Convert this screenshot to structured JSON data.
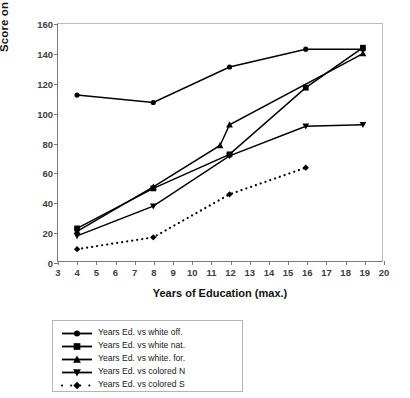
{
  "chart_data": {
    "type": "line",
    "title": "",
    "xlabel": "Years of Education (max.)",
    "ylabel": "Score on Army Mental Test",
    "xlim": [
      3,
      20
    ],
    "ylim": [
      0,
      160
    ],
    "xticks": [
      3,
      4,
      5,
      6,
      7,
      8,
      9,
      10,
      11,
      12,
      13,
      14,
      15,
      16,
      17,
      18,
      19,
      20
    ],
    "yticks": [
      0,
      20,
      40,
      60,
      80,
      100,
      120,
      140,
      160
    ],
    "grid": false,
    "legend_position": "below-plot",
    "series": [
      {
        "name": "Years Ed. vs white off.",
        "marker": "circle",
        "line": "solid",
        "x": [
          4,
          8,
          12,
          16,
          19
        ],
        "y": [
          112,
          107,
          131,
          143,
          143
        ]
      },
      {
        "name": "Years Ed. vs white nat.",
        "marker": "square",
        "line": "solid",
        "x": [
          4,
          8,
          12,
          16,
          19
        ],
        "y": [
          22,
          49,
          72,
          117,
          144
        ]
      },
      {
        "name": "Years Ed. vs white. for.",
        "marker": "triangle-up",
        "line": "solid",
        "x": [
          4,
          8,
          11.5,
          12,
          19
        ],
        "y": [
          20,
          50,
          78,
          92,
          140
        ]
      },
      {
        "name": "Years Ed. vs colored N",
        "marker": "triangle-down",
        "line": "solid",
        "x": [
          4,
          8,
          12,
          16,
          19
        ],
        "y": [
          17,
          37,
          71,
          91,
          92
        ]
      },
      {
        "name": "Years Ed. vs colored S",
        "marker": "diamond",
        "line": "dotted",
        "x": [
          4,
          8,
          12,
          16
        ],
        "y": [
          8,
          16,
          45,
          63
        ]
      }
    ]
  },
  "axes": {
    "y_label": "Score on Army Mental Test",
    "x_label": "Years of Education (max.)",
    "y_tick_labels": [
      "0",
      "20",
      "40",
      "60",
      "80",
      "100",
      "120",
      "140",
      "160"
    ],
    "x_tick_labels": [
      "3",
      "4",
      "5",
      "6",
      "7",
      "8",
      "9",
      "10",
      "11",
      "12",
      "13",
      "14",
      "15",
      "16",
      "17",
      "18",
      "19",
      "20"
    ]
  },
  "legend": {
    "items": [
      {
        "label": "Years Ed. vs white off.",
        "marker": "circle-marker"
      },
      {
        "label": "Years Ed. vs white nat.",
        "marker": "square-marker"
      },
      {
        "label": "Years Ed. vs white. for.",
        "marker": "triangle-up-marker"
      },
      {
        "label": "Years Ed. vs colored N",
        "marker": "triangle-down-marker"
      },
      {
        "label": "Years Ed. vs colored S",
        "marker": "diamond-marker"
      }
    ]
  },
  "colors": {
    "series": "#000000",
    "axis": "#7a7a7a",
    "tick_text": "#404040",
    "label_text": "#111111",
    "legend_border": "#b5b5b5",
    "background": "#ffffff"
  }
}
